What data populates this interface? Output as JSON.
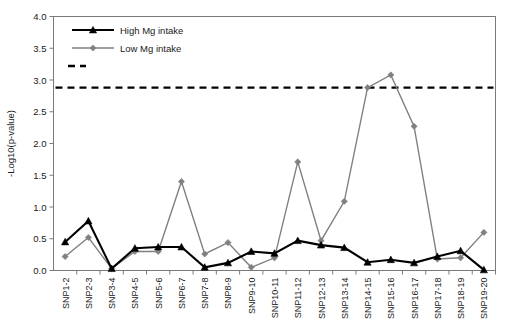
{
  "chart_data": {
    "type": "line",
    "title": "",
    "xlabel": "",
    "ylabel": "-Log10(p-value)",
    "ylim": [
      0.0,
      4.0
    ],
    "ytick_step": 0.5,
    "ytick_labels": [
      "0.0",
      "0.5",
      "1.0",
      "1.5",
      "2.0",
      "2.5",
      "3.0",
      "3.5",
      "4.0"
    ],
    "grid": false,
    "legend_position": "top-left-inside",
    "categories": [
      "SNP1-2",
      "SNP2-3",
      "SNP3-4",
      "SNP4-5",
      "SNP5-6",
      "SNP6-7",
      "SNP7-8",
      "SNP8-9",
      "SNP9-10",
      "SNP10-11",
      "SNP11-12",
      "SNP12-13",
      "SNP13-14",
      "SNP14-15",
      "SNP15-16",
      "SNP16-17",
      "SNP17-18",
      "SNP18-19",
      "SNP19-20"
    ],
    "series": [
      {
        "name": "High Mg intake",
        "color": "#000000",
        "marker": "triangle",
        "values": [
          0.45,
          0.78,
          0.03,
          0.35,
          0.37,
          0.37,
          0.05,
          0.12,
          0.3,
          0.27,
          0.47,
          0.4,
          0.36,
          0.13,
          0.17,
          0.12,
          0.22,
          0.31,
          0.01
        ]
      },
      {
        "name": "Low Mg intake",
        "color": "#808080",
        "marker": "diamond",
        "values": [
          0.22,
          0.52,
          0.03,
          0.3,
          0.3,
          1.4,
          0.26,
          0.44,
          0.05,
          0.2,
          1.71,
          0.47,
          1.09,
          2.88,
          3.08,
          2.27,
          0.18,
          0.2,
          0.6
        ]
      }
    ],
    "threshold_line": {
      "name": "significance-threshold",
      "value": 2.88,
      "style": "dashed",
      "color": "#000000"
    }
  },
  "legend": {
    "items": [
      {
        "label": "High Mg intake"
      },
      {
        "label": "Low Mg intake"
      }
    ]
  },
  "colors": {
    "high": "#000000",
    "low": "#808080",
    "axis": "#7a7a7a",
    "background": "#ffffff"
  }
}
